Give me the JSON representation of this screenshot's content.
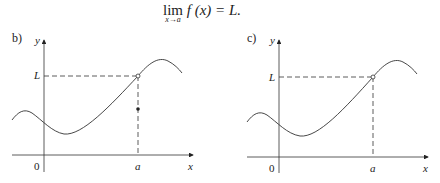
{
  "formula": {
    "lim": "lim",
    "subscript": "x→a",
    "expression": "f (x) = L."
  },
  "panels": [
    {
      "label": "b)",
      "y_axis_label": "y",
      "x_axis_label": "x",
      "origin_label": "0",
      "level_label": "L",
      "point_label": "a",
      "features": [
        "open circle at (a, L)",
        "filled dot below at x = a"
      ]
    },
    {
      "label": "c)",
      "y_axis_label": "y",
      "x_axis_label": "x",
      "origin_label": "0",
      "level_label": "L",
      "point_label": "a",
      "features": [
        "open circle at (a, L)"
      ]
    }
  ]
}
